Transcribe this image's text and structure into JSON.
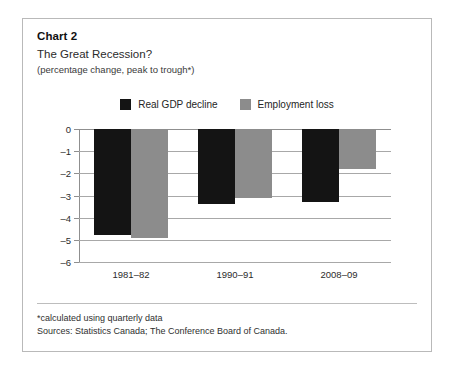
{
  "card": {
    "label": "Chart 2",
    "title": "The Great Recession?",
    "subtitle": "(percentage change, peak to trough*)"
  },
  "colors": {
    "gdp": "#141414",
    "employment": "#8c8c8c",
    "grid": "#a8a8a8",
    "axis": "#8f8f8f",
    "border": "#b9b9b9",
    "background": "#ffffff"
  },
  "footnotes": [
    "*calculated using quarterly data",
    "Sources: Statistics Canada; The Conference Board of Canada."
  ],
  "chart_data": {
    "type": "bar",
    "title": "The Great Recession?",
    "subtitle": "(percentage change, peak to trough*)",
    "xlabel": "",
    "ylabel": "",
    "ylim": [
      -6,
      0
    ],
    "yticks": [
      0,
      -1,
      -2,
      -3,
      -4,
      -5,
      -6
    ],
    "ytick_labels": [
      "0",
      "–1",
      "–2",
      "–3",
      "–4",
      "–5",
      "–6"
    ],
    "grid": true,
    "legend_position": "top-center",
    "orientation": "vertical-negative",
    "categories": [
      "1981–82",
      "1990–91",
      "2008–09"
    ],
    "series": [
      {
        "name": "Real GDP decline",
        "color": "#141414",
        "values": [
          -4.8,
          -3.4,
          -3.3
        ]
      },
      {
        "name": "Employment loss",
        "color": "#8c8c8c",
        "values": [
          -4.9,
          -3.1,
          -1.8
        ]
      }
    ]
  }
}
